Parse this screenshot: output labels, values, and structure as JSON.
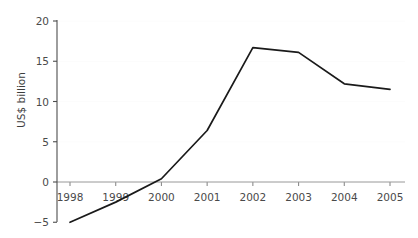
{
  "chart_data": {
    "type": "line",
    "title": "",
    "subtitle": "",
    "xlabel": "",
    "ylabel": "US$ billion",
    "categories": [
      "1998",
      "1999",
      "2000",
      "2001",
      "2002",
      "2003",
      "2004",
      "2005"
    ],
    "x": [
      1998,
      1999,
      2000,
      2001,
      2002,
      2003,
      2004,
      2005
    ],
    "values": [
      -5.0,
      -2.5,
      0.4,
      6.4,
      16.7,
      16.1,
      12.2,
      11.5
    ],
    "series": [
      {
        "name": "US$ billion",
        "values": [
          -5.0,
          -2.5,
          0.4,
          6.4,
          16.7,
          16.1,
          12.2,
          11.5
        ],
        "color": "#1a1a1a"
      }
    ],
    "ylim": [
      -5,
      20
    ],
    "xlim": [
      1998,
      2005
    ],
    "yticks": [
      -5,
      0,
      5,
      10,
      15,
      20
    ],
    "ytick_labels": [
      "−5",
      "0",
      "5",
      "10",
      "15",
      "20"
    ],
    "xticks": [
      1998,
      1999,
      2000,
      2001,
      2002,
      2003,
      2004,
      2005
    ],
    "xtick_labels": [
      "1998",
      "1999",
      "2000",
      "2001",
      "2002",
      "2003",
      "2004",
      "2005"
    ],
    "grid": true,
    "grid_axis": "y",
    "legend": false,
    "legend_position": "none",
    "annotations": [],
    "colors": {
      "line": "#1a1a1a",
      "background": "#ffffff",
      "grid": "#fcfcfc",
      "y_spine": "#4d4d4d",
      "x_spine": "#9a9a9a",
      "tick_text": "#4a4a4a",
      "axis_title": "#3d3d3d"
    }
  }
}
